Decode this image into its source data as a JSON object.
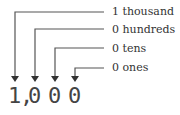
{
  "number": {
    "digits": [
      "1",
      ",",
      "0",
      "0",
      "0"
    ],
    "display": "1,000"
  },
  "labels": [
    {
      "digit": "1",
      "place": "thousand",
      "text": "1  thousand"
    },
    {
      "digit": "0",
      "place": "hundreds",
      "text": "0  hundreds"
    },
    {
      "digit": "0",
      "place": "tens",
      "text": "0  tens"
    },
    {
      "digit": "0",
      "place": "ones",
      "text": "0  ones"
    }
  ],
  "colors": {
    "line": "#555555",
    "text": "#333333"
  }
}
